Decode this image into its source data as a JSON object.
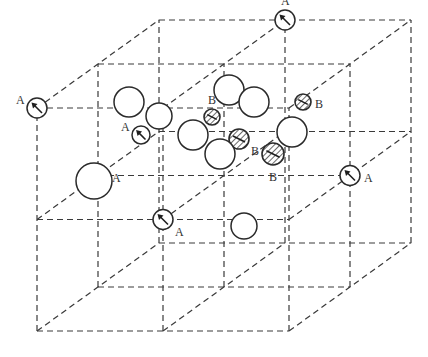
{
  "diagram": {
    "lattice": {
      "cells_per_axis": 2,
      "line_style": "dashed",
      "line_color": "#3a3a3a"
    },
    "legend_labels": {
      "A": "A",
      "B": "B"
    },
    "colors": {
      "outline": "#2a2a2a",
      "hatch": "#444444",
      "background": "#ffffff"
    },
    "atoms": [
      {
        "type": "A",
        "label": "A",
        "site": [
          0,
          2,
          0
        ],
        "label_side": "left"
      },
      {
        "type": "A",
        "label": "A",
        "site": [
          1,
          2,
          2
        ],
        "label_side": "above"
      },
      {
        "type": "A",
        "label": "A",
        "site": [
          1,
          1,
          0
        ],
        "label_side": "below-right"
      },
      {
        "type": "A",
        "label": "A",
        "site": [
          0,
          1,
          1
        ],
        "label_side": "right"
      },
      {
        "type": "A",
        "label": "A",
        "site": [
          2,
          1,
          1
        ],
        "label_side": "right"
      },
      {
        "type": "A",
        "label": "A",
        "site": "interstitial-1",
        "label_side": "left"
      },
      {
        "type": "A",
        "label": "A",
        "site": "interstitial-2",
        "label_side": "none"
      },
      {
        "type": "B",
        "label": "B",
        "site": "interstitial-3",
        "label_side": "above"
      },
      {
        "type": "B",
        "label": "B",
        "site": "interstitial-4",
        "label_side": "right"
      },
      {
        "type": "B",
        "label": "B",
        "site": "interstitial-5",
        "label_side": "below-right"
      },
      {
        "type": "B",
        "label": "B",
        "site": "interstitial-6",
        "label_side": "below"
      },
      {
        "type": "open",
        "label": "",
        "site": "interstitial-7"
      },
      {
        "type": "open",
        "label": "",
        "site": "interstitial-8"
      },
      {
        "type": "open",
        "label": "",
        "site": "interstitial-9"
      },
      {
        "type": "open",
        "label": "",
        "site": "interstitial-10"
      },
      {
        "type": "open",
        "label": "",
        "site": "interstitial-11"
      },
      {
        "type": "open",
        "label": "",
        "site": "interstitial-12"
      },
      {
        "type": "open",
        "label": "",
        "site": "interstitial-13"
      },
      {
        "type": "open",
        "label": "",
        "site": "interstitial-14"
      },
      {
        "type": "open",
        "label": "",
        "site": "interstitial-15"
      }
    ]
  }
}
